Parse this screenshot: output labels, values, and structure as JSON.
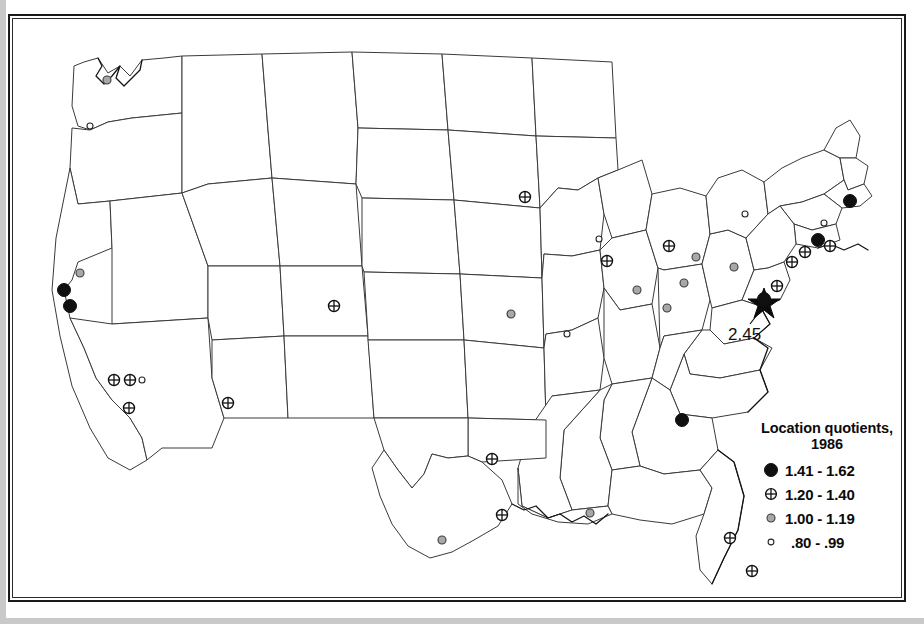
{
  "figure": {
    "type": "choropleth-point-map",
    "region": "United States (contiguous 48 states)",
    "frame": "double-ruled rectangular border"
  },
  "legend": {
    "title_line1": "Location quotients,",
    "title_line2": "1986",
    "classes": [
      {
        "symbol": "filled-black-circle",
        "label": "1.41 - 1.62",
        "min": 1.41,
        "max": 1.62,
        "color": "#101010",
        "size": 13
      },
      {
        "symbol": "crosshatch-circle",
        "label": "1.20 - 1.40",
        "min": 1.2,
        "max": 1.4,
        "color": "#ffffff",
        "size": 11
      },
      {
        "symbol": "gray-filled-circle",
        "label": "1.00 - 1.19",
        "min": 1.0,
        "max": 1.19,
        "color": "#a8a8a8",
        "size": 8
      },
      {
        "symbol": "small-open-circle",
        "label": ".80 - .99",
        "min": 0.8,
        "max": 0.99,
        "color": "#ffffff",
        "size": 6
      }
    ]
  },
  "annotation": {
    "value_label": "2.45",
    "symbol": "star",
    "description": "Washington DC outlier marked with star and leader line"
  },
  "chart_data": {
    "type": "scatter",
    "title": "Location quotients, 1986",
    "xlabel": "",
    "ylabel": "",
    "value_field": "location_quotient_class",
    "points": [
      {
        "name": "Seattle",
        "x": 95,
        "y": 62,
        "cls": 2
      },
      {
        "name": "Portland",
        "x": 78,
        "y": 108,
        "cls": 3
      },
      {
        "name": "San Francisco",
        "x": 52,
        "y": 272,
        "cls": 0
      },
      {
        "name": "Oakland",
        "x": 58,
        "y": 288,
        "cls": 0
      },
      {
        "name": "Sacramento",
        "x": 68,
        "y": 255,
        "cls": 2
      },
      {
        "name": "Los Angeles",
        "x": 102,
        "y": 362,
        "cls": 1
      },
      {
        "name": "Riverside",
        "x": 118,
        "y": 362,
        "cls": 1
      },
      {
        "name": "Anaheim",
        "x": 130,
        "y": 362,
        "cls": 3
      },
      {
        "name": "San Diego",
        "x": 117,
        "y": 390,
        "cls": 1
      },
      {
        "name": "Phoenix",
        "x": 216,
        "y": 385,
        "cls": 1
      },
      {
        "name": "Denver",
        "x": 322,
        "y": 288,
        "cls": 1
      },
      {
        "name": "Dallas",
        "x": 480,
        "y": 441,
        "cls": 1
      },
      {
        "name": "Houston",
        "x": 490,
        "y": 497,
        "cls": 1
      },
      {
        "name": "San Antonio",
        "x": 430,
        "y": 522,
        "cls": 2
      },
      {
        "name": "Minneapolis",
        "x": 513,
        "y": 179,
        "cls": 1
      },
      {
        "name": "Kansas City",
        "x": 499,
        "y": 296,
        "cls": 2
      },
      {
        "name": "St. Louis",
        "x": 555,
        "y": 316,
        "cls": 3
      },
      {
        "name": "Milwaukee",
        "x": 587,
        "y": 221,
        "cls": 3
      },
      {
        "name": "Chicago",
        "x": 595,
        "y": 243,
        "cls": 1
      },
      {
        "name": "Indianapolis",
        "x": 625,
        "y": 272,
        "cls": 2
      },
      {
        "name": "Cincinnati",
        "x": 655,
        "y": 290,
        "cls": 2
      },
      {
        "name": "Columbus",
        "x": 672,
        "y": 265,
        "cls": 2
      },
      {
        "name": "Cleveland",
        "x": 684,
        "y": 239,
        "cls": 2
      },
      {
        "name": "Detroit",
        "x": 657,
        "y": 228,
        "cls": 1
      },
      {
        "name": "Buffalo",
        "x": 733,
        "y": 196,
        "cls": 3
      },
      {
        "name": "Pittsburgh",
        "x": 722,
        "y": 249,
        "cls": 2
      },
      {
        "name": "Philadelphia",
        "x": 780,
        "y": 244,
        "cls": 1
      },
      {
        "name": "Baltimore",
        "x": 765,
        "y": 268,
        "cls": 1
      },
      {
        "name": "Washington DC",
        "x": 752,
        "y": 281,
        "cls": 0
      },
      {
        "name": "New York",
        "x": 806,
        "y": 222,
        "cls": 0
      },
      {
        "name": "Newark",
        "x": 793,
        "y": 234,
        "cls": 1
      },
      {
        "name": "Nassau",
        "x": 818,
        "y": 228,
        "cls": 1
      },
      {
        "name": "Hartford",
        "x": 812,
        "y": 205,
        "cls": 3
      },
      {
        "name": "Boston",
        "x": 838,
        "y": 183,
        "cls": 0
      },
      {
        "name": "Atlanta",
        "x": 670,
        "y": 402,
        "cls": 0
      },
      {
        "name": "New Orleans",
        "x": 578,
        "y": 495,
        "cls": 2
      },
      {
        "name": "Tampa",
        "x": 718,
        "y": 520,
        "cls": 1
      },
      {
        "name": "Miami",
        "x": 740,
        "y": 553,
        "cls": 1
      }
    ]
  }
}
